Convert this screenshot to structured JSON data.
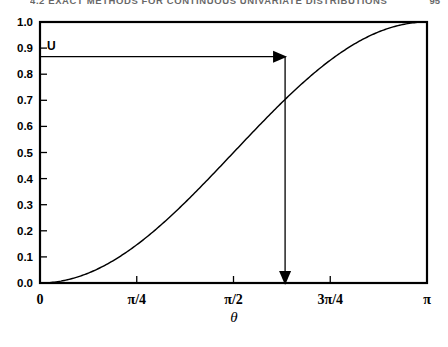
{
  "running_head": {
    "text": "4.2  EXACT METHODS FOR CONTINUOUS UNIVARIATE DISTRIBUTIONS",
    "page": "95"
  },
  "figure": {
    "u_label": "U",
    "x_axis_title": "θ"
  },
  "chart_data": {
    "type": "line",
    "title": "",
    "xlabel": "θ",
    "ylabel": "",
    "xlim": [
      0,
      3.14159265
    ],
    "ylim": [
      0,
      1.0
    ],
    "grid": false,
    "legend": null,
    "x_tick_values": [
      0,
      0.78539816,
      1.57079633,
      2.35619449,
      3.14159265
    ],
    "x_tick_labels": [
      "0",
      "π/4",
      "π/2",
      "3π/4",
      "π"
    ],
    "y_tick_values": [
      0.0,
      0.1,
      0.2,
      0.3,
      0.4,
      0.5,
      0.6,
      0.7,
      0.8,
      0.9,
      1.0
    ],
    "y_tick_labels": [
      "0.0",
      "0.1",
      "0.2",
      "0.3",
      "0.4",
      "0.5",
      "0.6",
      "0.7",
      "0.8",
      "0.9",
      "1.0"
    ],
    "series": [
      {
        "name": "F(θ) = (1 - cos θ)/2",
        "x": [
          0.0,
          0.15708,
          0.31416,
          0.47124,
          0.62832,
          0.7854,
          0.94248,
          1.09956,
          1.25664,
          1.41372,
          1.5708,
          1.72788,
          1.88496,
          2.04204,
          2.19911,
          2.35619,
          2.51327,
          2.67035,
          2.82743,
          2.98451,
          3.14159
        ],
        "y": [
          0.0,
          0.0123,
          0.0488,
          0.1088,
          0.191,
          0.2929,
          0.4122,
          0.546,
          0.6545,
          0.773,
          0.5,
          0.8774,
          0.9045,
          0.9619,
          0.9755,
          0.983,
          0.9938,
          0.9979,
          0.9988,
          0.9997,
          1.0
        ]
      }
    ],
    "annotations": [
      {
        "name": "u-horizontal-arrow",
        "label": "U",
        "from": [
          0.0,
          0.867
        ],
        "to": [
          1.9896,
          0.867
        ],
        "arrow": "end"
      },
      {
        "name": "theta-vertical-arrow",
        "from": [
          1.9896,
          0.867
        ],
        "to": [
          1.9896,
          0.0
        ],
        "arrow": "end"
      }
    ]
  }
}
